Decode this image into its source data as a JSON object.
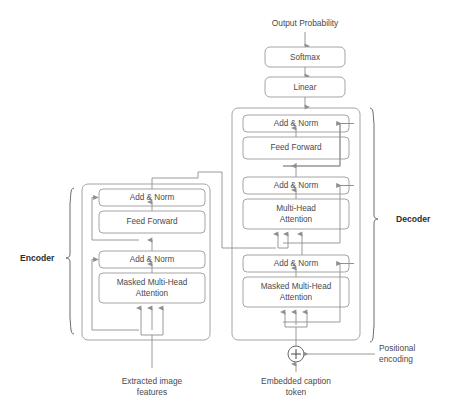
{
  "diagram": {
    "output_label": "Output Probability",
    "encoder_label": "Encoder",
    "decoder_label": "Decoder",
    "encoder_input_label_line1": "Extracted image",
    "encoder_input_label_line2": "features",
    "decoder_input_label_line1": "Embedded caption",
    "decoder_input_label_line2": "token",
    "positional_label_line1": "Positional",
    "positional_label_line2": "encoding",
    "add_symbol": "+"
  },
  "head": {
    "softmax": "Softmax",
    "linear": "Linear"
  },
  "encoder": {
    "blocks": [
      {
        "name": "add-norm-top",
        "label": "Add & Norm"
      },
      {
        "name": "feed-forward",
        "label": "Feed Forward"
      },
      {
        "name": "add-norm-bottom",
        "label": "Add & Norm"
      },
      {
        "name": "attention",
        "label_line1": "Masked Multi-Head",
        "label_line2": "Attention"
      }
    ]
  },
  "decoder": {
    "blocks": [
      {
        "name": "add-norm-top",
        "label": "Add & Norm"
      },
      {
        "name": "feed-forward",
        "label": "Feed Forward"
      },
      {
        "name": "add-norm-middle",
        "label": "Add & Norm"
      },
      {
        "name": "cross-attention",
        "label_line1": "Multi-Head",
        "label_line2": "Attention"
      },
      {
        "name": "add-norm-bottom",
        "label": "Add & Norm"
      },
      {
        "name": "self-attention",
        "label_line1": "Masked Multi-Head",
        "label_line2": "Attention"
      }
    ]
  },
  "colors": {
    "background": "#ffffff",
    "box_stroke": "#9a9a9a",
    "wire": "#8f8f8f",
    "text": "#4a4a4a",
    "side_label_text": "#2e2e2e"
  }
}
